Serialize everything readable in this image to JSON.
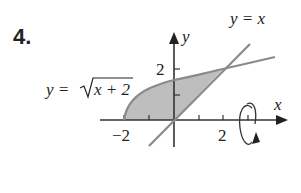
{
  "problem": {
    "number": "4."
  },
  "graph": {
    "axes": {
      "x_label": "x",
      "y_label": "y"
    },
    "ticks": {
      "x_neg": "−2",
      "x_pos": "2",
      "y_pos": "2"
    },
    "curves": {
      "sqrt_label_prefix": "y = ",
      "sqrt_label_radicand": "x + 2",
      "line_label": "y = x"
    },
    "colors": {
      "shade": "#aaaaaa",
      "curve": "#8a8a8a",
      "axis": "#333333"
    },
    "rotation_indicator": "rotate-about-vertical-line"
  }
}
